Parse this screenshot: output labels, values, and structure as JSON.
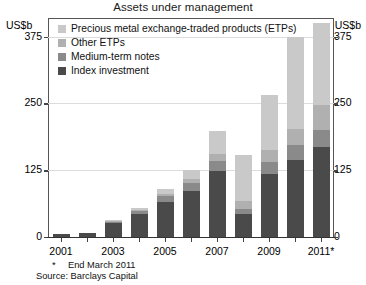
{
  "header": {
    "title": "Assets under management",
    "unit_left": "US$b",
    "unit_right": "US$b"
  },
  "legend": {
    "items": [
      {
        "label": "Precious metal exchange-traded products (ETPs)",
        "color": "#c9c9c9",
        "name": "legend-precious-metal-etps"
      },
      {
        "label": "Other ETPs",
        "color": "#b0b0b0",
        "name": "legend-other-etps"
      },
      {
        "label": "Medium-term notes",
        "color": "#8a8a8a",
        "name": "legend-medium-term-notes"
      },
      {
        "label": "Index investment",
        "color": "#4a4a4a",
        "name": "legend-index-investment"
      }
    ]
  },
  "footnotes": {
    "star_marker": "*",
    "star_text": "End March 2011",
    "source": "Source: Barclays Capital"
  },
  "chart_data": {
    "type": "bar",
    "subtype": "stacked-vertical",
    "title": "Assets under management",
    "xlabel": "",
    "ylabel": "US$b",
    "ylim": [
      0,
      410
    ],
    "yticks": [
      0,
      125,
      250,
      375
    ],
    "ytick_labels": [
      "0",
      "125",
      "250",
      "375"
    ],
    "grid": true,
    "grid_axis": "y",
    "legend_position": "top-left-inside",
    "dual_y_axis": true,
    "categories": [
      "2001",
      "2002",
      "2003",
      "2004",
      "2005",
      "2006",
      "2007",
      "2008",
      "2009",
      "2010",
      "2011*"
    ],
    "xtick_labels": [
      "2001",
      "",
      "2003",
      "",
      "2005",
      "",
      "2007",
      "",
      "2009",
      "",
      "2011*"
    ],
    "series": [
      {
        "name": "Index investment",
        "color": "#4a4a4a",
        "values": [
          5,
          8,
          26,
          43,
          66,
          87,
          124,
          44,
          118,
          145,
          168
        ]
      },
      {
        "name": "Medium-term notes",
        "color": "#8a8a8a",
        "values": [
          0,
          0,
          3,
          6,
          10,
          14,
          19,
          9,
          22,
          28,
          32
        ]
      },
      {
        "name": "Other ETPs",
        "color": "#b0b0b0",
        "values": [
          0,
          0,
          1,
          2,
          5,
          8,
          13,
          14,
          22,
          30,
          48
        ]
      },
      {
        "name": "Precious metal exchange-traded products (ETPs)",
        "color": "#c9c9c9",
        "values": [
          0,
          0,
          1,
          3,
          9,
          16,
          42,
          86,
          104,
          172,
          152
        ]
      }
    ],
    "totals": [
      5,
      8,
      31,
      54,
      90,
      125,
      198,
      153,
      266,
      375,
      400
    ]
  }
}
